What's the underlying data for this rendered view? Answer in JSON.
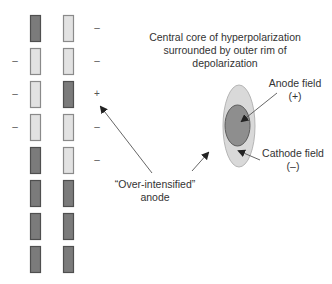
{
  "diagram": {
    "electrode_array": {
      "columns": [
        {
          "name": "left-column",
          "x": 30,
          "electrodes": [
            {
              "state": "dark",
              "sign": ""
            },
            {
              "state": "light",
              "sign": "–"
            },
            {
              "state": "light",
              "sign": "–"
            },
            {
              "state": "light",
              "sign": "–"
            },
            {
              "state": "dark",
              "sign": ""
            },
            {
              "state": "dark",
              "sign": ""
            },
            {
              "state": "dark",
              "sign": ""
            },
            {
              "state": "dark",
              "sign": ""
            }
          ]
        },
        {
          "name": "right-column",
          "x": 63,
          "electrodes": [
            {
              "state": "light",
              "sign": "–"
            },
            {
              "state": "light",
              "sign": "–"
            },
            {
              "state": "dark",
              "sign": "+"
            },
            {
              "state": "light",
              "sign": "–"
            },
            {
              "state": "light",
              "sign": "–"
            },
            {
              "state": "dark",
              "sign": ""
            },
            {
              "state": "dark",
              "sign": ""
            },
            {
              "state": "dark",
              "sign": ""
            }
          ]
        }
      ]
    },
    "labels": {
      "core_description_line1": "Central core of hyperpolarization",
      "core_description_line2": "surrounded by outer rim of",
      "core_description_line3": "depolarization",
      "anode_field": "Anode field",
      "anode_sign": "(+)",
      "cathode_field": "Cathode field",
      "cathode_sign": "(–)",
      "over_intensified_line1": "“Over-intensified”",
      "over_intensified_line2": "anode"
    },
    "colors": {
      "electrode_dark_fill": "#7b7b7b",
      "electrode_dark_stroke": "#4f4f4f",
      "electrode_light_fill": "#e2e2e2",
      "electrode_light_stroke": "#8a8a8a",
      "outer_field_fill": "#d9d9d9",
      "outer_field_stroke": "#b5b5b5",
      "inner_field_fill": "#8e8e8e",
      "inner_field_stroke": "#5c5c5c",
      "arrow": "#444444"
    }
  }
}
